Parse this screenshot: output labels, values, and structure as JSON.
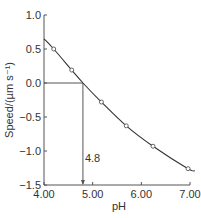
{
  "chart_data": {
    "type": "line",
    "title": "",
    "xlabel": "pH",
    "ylabel": "Speed/(µm s⁻¹)",
    "xlim": [
      4.0,
      7.0
    ],
    "ylim": [
      -1.5,
      1.0
    ],
    "x_ticks": [
      "4.00",
      "5.00",
      "6.00",
      "7.00"
    ],
    "y_ticks": [
      "1.0",
      "0.5",
      "0.0",
      "−0.5",
      "−1.0",
      "−1.5"
    ],
    "grid": false,
    "legend": null,
    "series": [
      {
        "name": "Electrophoretic speed",
        "markers": "open-circle",
        "x": [
          4.2,
          4.57,
          5.18,
          5.69,
          6.24,
          6.96
        ],
        "y": [
          0.5,
          0.19,
          -0.28,
          -0.63,
          -0.93,
          -1.26
        ]
      }
    ],
    "fit_curve": {
      "x": [
        4.0,
        4.2,
        4.57,
        4.8,
        5.18,
        5.69,
        6.24,
        6.96,
        7.1
      ],
      "y": [
        0.65,
        0.5,
        0.19,
        0.0,
        -0.28,
        -0.63,
        -0.93,
        -1.26,
        -1.29
      ]
    },
    "annotations": [
      {
        "type": "guide-line",
        "from": [
          4.0,
          0.0
        ],
        "to": [
          4.8,
          0.0
        ]
      },
      {
        "type": "arrow",
        "from": [
          4.8,
          0.0
        ],
        "to": [
          4.8,
          -1.5
        ]
      },
      {
        "type": "text",
        "text": "4.8",
        "x": 4.82,
        "y": -1.1
      }
    ]
  },
  "labels": {
    "xlabel": "pH",
    "ylabel": "Speed/(µm s⁻¹)",
    "annotation": "4.8"
  }
}
